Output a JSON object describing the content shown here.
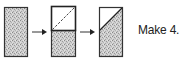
{
  "diagram": {
    "caption": "Make 4.",
    "steps": [
      {
        "id": "step-1",
        "description": "Full shaded rectangle"
      },
      {
        "id": "step-2",
        "description": "White square on top of shaded rectangle with dashed diagonal fold line"
      },
      {
        "id": "step-3",
        "description": "Rectangle with white top-left triangle and shaded remainder, diagonal sewn line"
      }
    ],
    "colors": {
      "fabric": "#c8c8c8",
      "outline": "#333333",
      "white": "#ffffff"
    }
  }
}
